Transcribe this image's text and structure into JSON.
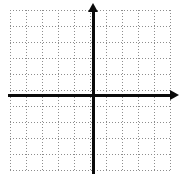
{
  "figure": {
    "kind": "cartesian-coordinate-grid",
    "title": "",
    "width_px": 180,
    "height_px": 182,
    "background_color": "#ffffff"
  },
  "chart_data": {
    "type": "scatter",
    "title": "",
    "subtitle": "",
    "xlabel": "",
    "ylabel": "",
    "x": [],
    "y": [],
    "series": [],
    "annotations": [],
    "legend": {
      "entries": [],
      "position": "none",
      "visible": false
    },
    "grid": {
      "visible": true,
      "style": "dotted",
      "color": "#8d8d8d",
      "cell_size_px": 16,
      "columns": 10,
      "rows": 10,
      "left_px": 10,
      "top_px": 10,
      "width_px": 160,
      "height_px": 162
    },
    "axes": {
      "color": "#0a0a0a",
      "thickness_px": 3,
      "origin_px": {
        "x": 93,
        "y": 95
      },
      "x_axis": {
        "visible": true,
        "start_px": 8,
        "end_px": 172,
        "arrow_right": true,
        "arrow_left": false,
        "tick_labels": [],
        "range": [
          -5,
          5
        ]
      },
      "y_axis": {
        "visible": true,
        "start_px": 10,
        "end_px": 174,
        "arrow_up": true,
        "arrow_down": false,
        "tick_labels": [],
        "range": [
          -5,
          5
        ]
      }
    },
    "data_points_plotted": 0
  },
  "accessibility": {
    "alt_text": "Blank Cartesian coordinate grid with a vertical y-axis and horizontal x-axis drawn in black over light dotted graph paper."
  }
}
